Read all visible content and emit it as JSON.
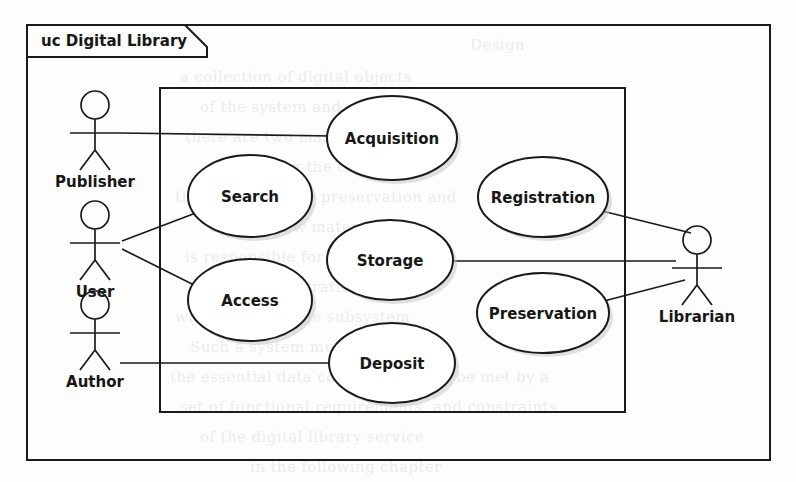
{
  "diagram": {
    "kind": "uml-use-case-diagram",
    "frame_label": "uc Digital Library",
    "frame_label_prefix": "uc",
    "frame_label_name": "Digital Library",
    "colors": {
      "page_background": "#fdfdfc",
      "ink": "#1a1a1a",
      "shape_fill": "#ffffff",
      "shadow": "#c9c9c9",
      "ghost_text": "#3a3630"
    },
    "outer_frame": {
      "x": 27,
      "y": 25,
      "width": 743,
      "height": 435
    },
    "system_boundary": {
      "x": 160,
      "y": 88,
      "width": 465,
      "height": 324
    }
  },
  "actors": [
    {
      "id": "publisher",
      "label": "Publisher",
      "side": "left",
      "head_cx": 95,
      "head_cy": 105,
      "label_x": 95,
      "label_y": 178
    },
    {
      "id": "user",
      "label": "User",
      "side": "left",
      "head_cx": 95,
      "head_cy": 215,
      "label_x": 95,
      "label_y": 288
    },
    {
      "id": "author",
      "label": "Author",
      "side": "left",
      "head_cx": 95,
      "head_cy": 305,
      "label_x": 95,
      "label_y": 378
    },
    {
      "id": "librarian",
      "label": "Librarian",
      "side": "right",
      "head_cx": 697,
      "head_cy": 240,
      "label_x": 697,
      "label_y": 313
    }
  ],
  "use_cases": [
    {
      "id": "acquisition",
      "label": "Acquisition",
      "cx": 392,
      "cy": 138,
      "rx": 65,
      "ry": 42
    },
    {
      "id": "search",
      "label": "Search",
      "cx": 250,
      "cy": 196,
      "rx": 62,
      "ry": 41
    },
    {
      "id": "registration",
      "label": "Registration",
      "cx": 543,
      "cy": 197,
      "rx": 65,
      "ry": 40
    },
    {
      "id": "storage",
      "label": "Storage",
      "cx": 390,
      "cy": 260,
      "rx": 63,
      "ry": 40
    },
    {
      "id": "access",
      "label": "Access",
      "cx": 250,
      "cy": 300,
      "rx": 62,
      "ry": 41
    },
    {
      "id": "preservation",
      "label": "Preservation",
      "cx": 543,
      "cy": 313,
      "rx": 66,
      "ry": 40
    },
    {
      "id": "deposit",
      "label": "Deposit",
      "cx": 392,
      "cy": 363,
      "rx": 63,
      "ry": 40
    }
  ],
  "associations": [
    {
      "id": "publisher-acquisition",
      "from": "publisher",
      "to": "acquisition",
      "x1": 120,
      "y1": 133,
      "x2": 329,
      "y2": 136
    },
    {
      "id": "user-search",
      "from": "user",
      "to": "search",
      "x1": 122,
      "y1": 241,
      "x2": 200,
      "y2": 212
    },
    {
      "id": "user-access",
      "from": "user",
      "to": "access",
      "x1": 122,
      "y1": 248,
      "x2": 199,
      "y2": 288
    },
    {
      "id": "author-deposit",
      "from": "author",
      "to": "deposit",
      "x1": 120,
      "y1": 363,
      "x2": 330,
      "y2": 363
    },
    {
      "id": "storage-librarian",
      "from": "storage",
      "to": "librarian",
      "x1": 453,
      "y1": 261,
      "x2": 675,
      "y2": 261
    },
    {
      "id": "registration-librarian",
      "from": "registration",
      "to": "librarian",
      "x1": 600,
      "y1": 208,
      "x2": 690,
      "y2": 232
    },
    {
      "id": "preservation-librarian",
      "from": "preservation",
      "to": "librarian",
      "x1": 601,
      "y1": 303,
      "x2": 684,
      "y2": 281
    }
  ],
  "ghost_text_lines": [
    {
      "x": 470,
      "y": 30,
      "text": "Design"
    },
    {
      "x": 180,
      "y": 62,
      "text": "a collection of digital objects"
    },
    {
      "x": 200,
      "y": 92,
      "text": "of the system and  its users"
    },
    {
      "x": 185,
      "y": 122,
      "text": "there are two main kinds of users"
    },
    {
      "x": 205,
      "y": 152,
      "text": "and reading the content of"
    },
    {
      "x": 175,
      "y": 182,
      "text": "the repository for preservation and"
    },
    {
      "x": 210,
      "y": 212,
      "text": "deposit new material into"
    },
    {
      "x": 185,
      "y": 242,
      "text": "is responsible for the acquisition"
    },
    {
      "x": 200,
      "y": 272,
      "text": "and the registration of items"
    },
    {
      "x": 175,
      "y": 302,
      "text": "within the storage subsystem"
    },
    {
      "x": 190,
      "y": 332,
      "text": "Such a system must be able"
    },
    {
      "x": 170,
      "y": 362,
      "text": "the essential data collection and to be met by a"
    },
    {
      "x": 180,
      "y": 392,
      "text": "set of functional requirements  and constraints"
    },
    {
      "x": 200,
      "y": 422,
      "text": "of the digital library service"
    },
    {
      "x": 250,
      "y": 452,
      "text": "in the following chapter"
    }
  ]
}
